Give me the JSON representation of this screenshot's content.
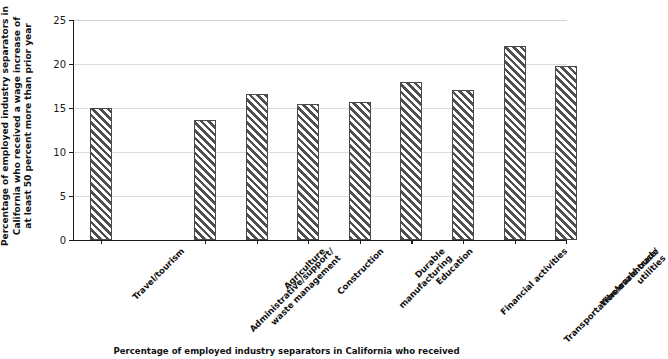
{
  "chart_data": {
    "type": "bar",
    "title": "",
    "subtitle": "",
    "xlabel": "",
    "ylabel": "Percentage of employed industry separators in California who received a wage increase of at least 50 percent more than prior year",
    "ylabel_lines": [
      "Percentage of employed industry separators in",
      "California who received a wage increase of",
      "at least 50 percent more than prior year"
    ],
    "categories": [
      "Travel/tourism",
      "Administrative/support/waste management",
      "Agriculture",
      "Construction",
      "Durable manufacturing",
      "Education",
      "Financial activities",
      "Transportation/warehouse/utilities",
      "Wholesale trade"
    ],
    "category_label_lines": [
      [
        "Travel/tourism"
      ],
      [
        "Administrative/support/",
        "waste management"
      ],
      [
        "Agriculture"
      ],
      [
        "Construction"
      ],
      [
        "Durable",
        "manufacturing"
      ],
      [
        "Education"
      ],
      [
        "Financial activities"
      ],
      [
        "Transportation/warehouse/",
        "utilities"
      ],
      [
        "Wholesale trade"
      ]
    ],
    "values": [
      15.0,
      13.6,
      16.6,
      15.4,
      15.7,
      18.0,
      17.1,
      22.1,
      19.8
    ],
    "ylim": [
      0,
      25
    ],
    "yticks": [
      0,
      5,
      10,
      15,
      20,
      25
    ],
    "ytick_labels": [
      "0",
      "5",
      "10",
      "15",
      "20",
      "25"
    ],
    "grid": true,
    "legend": false,
    "legend_position": "none",
    "bar_fill": "diagonal-hatch",
    "bar_color": "#4f4f4f",
    "grid_color": "#dcdcdc",
    "axis_color": "#1a1a1a"
  },
  "caption": {
    "text": "Percentage of employed industry separators in California who received"
  }
}
